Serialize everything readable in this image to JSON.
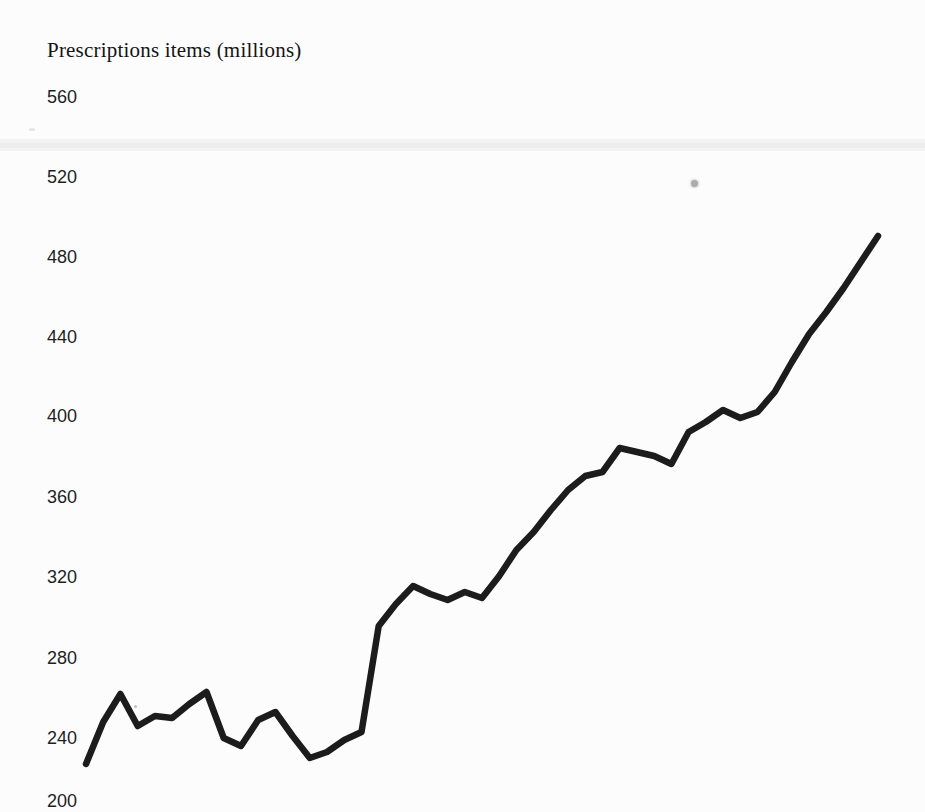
{
  "page": {
    "background_color": "#fcfcfc"
  },
  "colors": {
    "line": "#1c1c1c",
    "tick_text": "#1f1f1f",
    "title_text": "#141414"
  },
  "chart_data": {
    "type": "line",
    "title": "Prescriptions items (millions)",
    "ylabel": "Prescriptions items (millions)",
    "xlabel": "",
    "ylim": [
      200,
      560
    ],
    "y_ticks": [
      560,
      520,
      480,
      440,
      400,
      360,
      320,
      280,
      240,
      200
    ],
    "x_tick_labels": [],
    "grid": false,
    "legend": false,
    "num_points": 47,
    "x": [
      1,
      2,
      3,
      4,
      5,
      6,
      7,
      8,
      9,
      10,
      11,
      12,
      13,
      14,
      15,
      16,
      17,
      18,
      19,
      20,
      21,
      22,
      23,
      24,
      25,
      26,
      27,
      28,
      29,
      30,
      31,
      32,
      33,
      34,
      35,
      36,
      37,
      38,
      39,
      40,
      41,
      42,
      43,
      44,
      45,
      46,
      47
    ],
    "series": [
      {
        "name": "Prescription items (millions)",
        "values": [
          227,
          248,
          262,
          246,
          251,
          250,
          257,
          263,
          240,
          236,
          249,
          253,
          241,
          230,
          233,
          239,
          243,
          296,
          307,
          316,
          312,
          309,
          313,
          310,
          321,
          334,
          343,
          354,
          364,
          371,
          373,
          385,
          383,
          381,
          377,
          393,
          398,
          404,
          400,
          403,
          413,
          428,
          442,
          453,
          465,
          478,
          491
        ]
      }
    ]
  }
}
